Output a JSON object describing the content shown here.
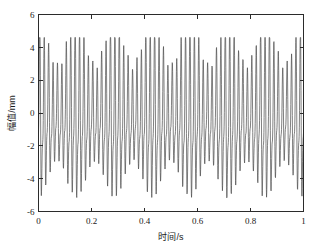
{
  "chart_data": {
    "type": "line",
    "title": "",
    "xlabel": "时间/s",
    "ylabel": "幅值/mm",
    "xlim": [
      0,
      1
    ],
    "ylim": [
      -6,
      6
    ],
    "xticks": [
      "0",
      "0.2",
      "0.4",
      "0.6",
      "0.8",
      "1"
    ],
    "xtick_values": [
      0,
      0.2,
      0.4,
      0.6,
      0.8,
      1
    ],
    "yticks": [
      "6",
      "4",
      "2",
      "0",
      "-2",
      "-4",
      "-6"
    ],
    "ytick_values": [
      6,
      4,
      2,
      0,
      -2,
      -4,
      -6
    ],
    "grid": false,
    "legend": false,
    "line_color": "#4a4a4a",
    "frame_color": "#2b2b2b",
    "background_color": "#ffffff",
    "series": [
      {
        "name": "vibration-signal",
        "description": "Amplitude-modulated vibration waveform, ~60 Hz carrier with ~7 Hz beat envelope",
        "carrier_frequency_hz": 60,
        "beat_frequency_hz": 7,
        "secondary_frequency_hz": 120,
        "envelope_min": 2.4,
        "envelope_max": 4.5,
        "positive_peak_max": 4.6,
        "negative_peak_min": -5.3,
        "dc_offset": -0.35,
        "sample_count": 1400
      }
    ],
    "annotations": []
  },
  "figure": {
    "axis_label_x": "时间/s",
    "axis_label_y": "幅值/mm"
  }
}
